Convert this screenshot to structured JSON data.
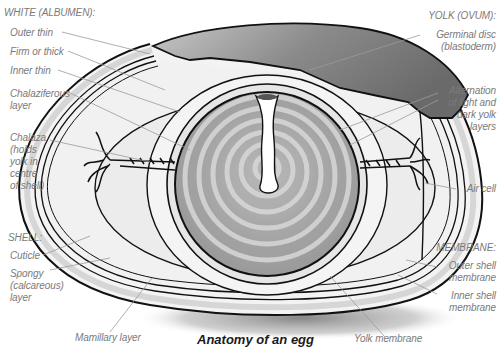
{
  "title": "Anatomy of an egg",
  "groups": {
    "white": {
      "heading": "WHITE (ALBUMEN):",
      "items": [
        "Outer thin",
        "Firm or thick",
        "Inner thin",
        "Chalaziferous\nlayer",
        "Chalaza\n(holds\nyolk in\ncentre\nof shell)"
      ]
    },
    "shell": {
      "heading": "SHELL:",
      "items": [
        "Cuticle",
        "Spongy\n(calcareous)\nlayer",
        "Mamillary layer"
      ]
    },
    "yolk": {
      "heading": "YOLK (OVUM):",
      "items": [
        "Germinal disc\n(blastoderm)",
        "Alternation\nof light and\ndark yolk\nlayers"
      ]
    },
    "other": {
      "air_cell": "Air cell"
    },
    "membrane": {
      "heading": "MEMBRANE:",
      "items": [
        "Outer shell\nmembrane",
        "Inner shell\nmembrane",
        "Yolk membrane"
      ]
    }
  },
  "colors": {
    "label_text": "#7a7a7a",
    "title_text": "#1a1a1a",
    "outline": "#111111",
    "leader_line": "#9a9a9a",
    "shell_band": "#d8d8d8",
    "albumen": "#f0f0f0",
    "yolk_dark": "#a8a8a8",
    "yolk_light": "#d4d4d4",
    "shadow": "#9a9a9a"
  }
}
